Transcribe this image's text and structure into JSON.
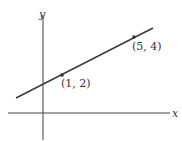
{
  "diagram": {
    "axes": {
      "x_label": "x",
      "y_label": "y"
    },
    "line": {
      "description": "straight line through two labeled points",
      "color": "#3a3a3a"
    },
    "points": [
      {
        "label": "(1, 2)",
        "x": 1,
        "y": 2
      },
      {
        "label": "(5, 4)",
        "x": 5,
        "y": 4
      }
    ]
  }
}
